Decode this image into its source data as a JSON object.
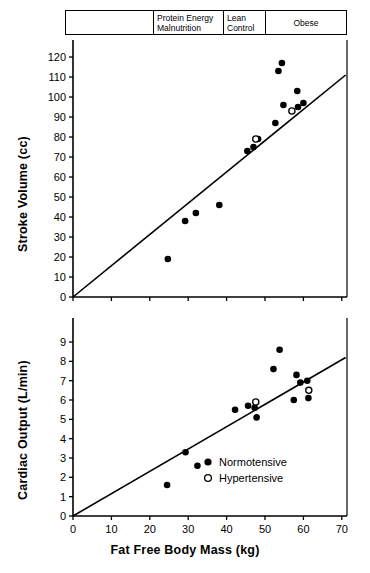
{
  "group_header": {
    "cells": [
      {
        "label": "",
        "name": "group-cell-blank"
      },
      {
        "label": "Protein Energy\nMalnutrition",
        "name": "group-cell-pem"
      },
      {
        "label": "Lean\nControl",
        "name": "group-cell-lean"
      },
      {
        "label": "Obese",
        "name": "group-cell-obese"
      }
    ]
  },
  "axis_titles": {
    "y_top": "Stroke Volume (cc)",
    "y_bottom": "Cardiac Output (L/min)",
    "x": "Fat Free Body Mass  (kg)"
  },
  "legend": {
    "items": [
      {
        "marker": "filled-circle",
        "label": "Normotensive"
      },
      {
        "marker": "open-circle",
        "label": "Hypertensive"
      }
    ]
  },
  "colors": {
    "ink": "#000000",
    "paper": "#ffffff"
  },
  "chart_data": [
    {
      "id": "stroke-volume",
      "type": "scatter",
      "title": "",
      "xlabel": "Fat Free Body Mass (kg)",
      "ylabel": "Stroke Volume (cc)",
      "xlim": [
        0,
        75
      ],
      "ylim": [
        0,
        127
      ],
      "xticks": [
        0,
        10,
        20,
        30,
        40,
        50,
        60,
        70
      ],
      "yticks": [
        0,
        10,
        20,
        30,
        40,
        50,
        60,
        70,
        80,
        90,
        100,
        110,
        120
      ],
      "grid": false,
      "legend_position": "none",
      "series": [
        {
          "name": "Normotensive",
          "marker": "filled-circle",
          "points": [
            [
              24.7,
              19
            ],
            [
              29.2,
              38
            ],
            [
              32.0,
              42
            ],
            [
              38.1,
              46
            ],
            [
              45.4,
              73
            ],
            [
              47.0,
              75
            ],
            [
              48.2,
              79
            ],
            [
              52.7,
              87
            ],
            [
              54.4,
              117
            ],
            [
              53.5,
              113
            ],
            [
              54.8,
              96
            ],
            [
              58.6,
              95
            ],
            [
              60.0,
              97
            ],
            [
              58.4,
              103
            ]
          ]
        },
        {
          "name": "Hypertensive",
          "marker": "open-circle",
          "points": [
            [
              47.6,
              79
            ],
            [
              57.0,
              93
            ]
          ]
        }
      ],
      "fit_line": {
        "x": [
          0,
          71
        ],
        "y": [
          0,
          111
        ]
      }
    },
    {
      "id": "cardiac-output",
      "type": "scatter",
      "title": "",
      "xlabel": "Fat Free Body Mass (kg)",
      "ylabel": "Cardiac Output (L/min)",
      "xlim": [
        0,
        75
      ],
      "ylim": [
        0,
        9.8
      ],
      "xticks": [
        0,
        10,
        20,
        30,
        40,
        50,
        60,
        70
      ],
      "yticks": [
        0,
        1,
        2,
        3,
        4,
        5,
        6,
        7,
        8,
        9
      ],
      "grid": false,
      "legend_position": "inside-lower-right",
      "series": [
        {
          "name": "Normotensive",
          "marker": "filled-circle",
          "points": [
            [
              24.5,
              1.6
            ],
            [
              29.3,
              3.3
            ],
            [
              32.4,
              2.6
            ],
            [
              42.2,
              5.5
            ],
            [
              45.6,
              5.7
            ],
            [
              47.3,
              5.6
            ],
            [
              47.8,
              5.1
            ],
            [
              53.8,
              8.6
            ],
            [
              52.2,
              7.6
            ],
            [
              58.2,
              7.3
            ],
            [
              59.2,
              6.9
            ],
            [
              57.5,
              6.0
            ],
            [
              61.3,
              6.1
            ],
            [
              61.0,
              7.0
            ]
          ]
        },
        {
          "name": "Hypertensive",
          "marker": "open-circle",
          "points": [
            [
              47.6,
              5.9
            ],
            [
              61.4,
              6.5
            ]
          ]
        }
      ],
      "fit_line": {
        "x": [
          0,
          71
        ],
        "y": [
          0,
          8.2
        ]
      }
    }
  ]
}
